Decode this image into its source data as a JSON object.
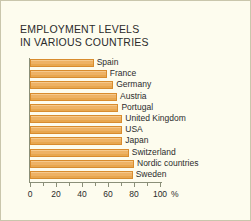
{
  "chart_data": {
    "type": "bar",
    "orientation": "horizontal",
    "title": "EMPLOYMENT LEVELS\nIN VARIOUS COUNTRIES",
    "xlabel": "%",
    "ylabel": "",
    "xlim": [
      0,
      100
    ],
    "grid": false,
    "legend": "none",
    "bar_color": "#eeb266",
    "bar_edge_color": "#d88c2e",
    "background_color": "#fdfcee",
    "axis_color": "#8a8f78",
    "text_color": "#2b2b2b",
    "xticks": [
      {
        "value": 0,
        "label": "0",
        "major": true
      },
      {
        "value": 10,
        "label": "",
        "major": false
      },
      {
        "value": 20,
        "label": "20",
        "major": true
      },
      {
        "value": 30,
        "label": "",
        "major": false
      },
      {
        "value": 40,
        "label": "40",
        "major": true
      },
      {
        "value": 50,
        "label": "",
        "major": false
      },
      {
        "value": 60,
        "label": "60",
        "major": true
      },
      {
        "value": 70,
        "label": "",
        "major": false
      },
      {
        "value": 80,
        "label": "80",
        "major": true
      },
      {
        "value": 90,
        "label": "",
        "major": false
      },
      {
        "value": 100,
        "label": "100",
        "major": true
      }
    ],
    "unit_label": "%",
    "categories": [
      "Spain",
      "France",
      "Germany",
      "Austria",
      "Portugal",
      "United Kingdom",
      "USA",
      "Japan",
      "Switzerland",
      "Nordic countries",
      "Sweden"
    ],
    "values": [
      49,
      59,
      64,
      67,
      68,
      71,
      71,
      71,
      76,
      80,
      79
    ]
  }
}
